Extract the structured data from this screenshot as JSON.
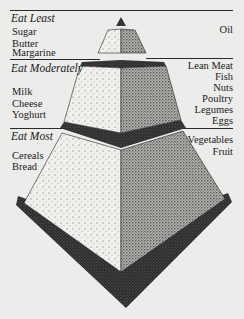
{
  "diagram": {
    "type": "food-pyramid",
    "tiers": [
      {
        "id": "eat-least",
        "heading": "Eat Least",
        "left_items": [
          "Sugar",
          "Butter",
          "Margarine"
        ],
        "right_items": [
          "Oil"
        ]
      },
      {
        "id": "eat-moderately",
        "heading": "Eat Moderately",
        "left_items": [
          "Milk",
          "Cheese",
          "Yoghurt"
        ],
        "right_items": [
          "Lean Meat",
          "Fish",
          "Nuts",
          "Poultry",
          "Legumes",
          "Eggs"
        ]
      },
      {
        "id": "eat-most",
        "heading": "Eat Most",
        "left_items": [
          "Cereals",
          "Bread"
        ],
        "right_items": [
          "Vegetables",
          "Fruit"
        ]
      }
    ]
  },
  "colors": {
    "background": "#ececea",
    "ink": "#1a1a1a",
    "light_face": "#f2f1ee",
    "dark_face": "#9a9a98",
    "shadow": "#2a2a2a"
  }
}
